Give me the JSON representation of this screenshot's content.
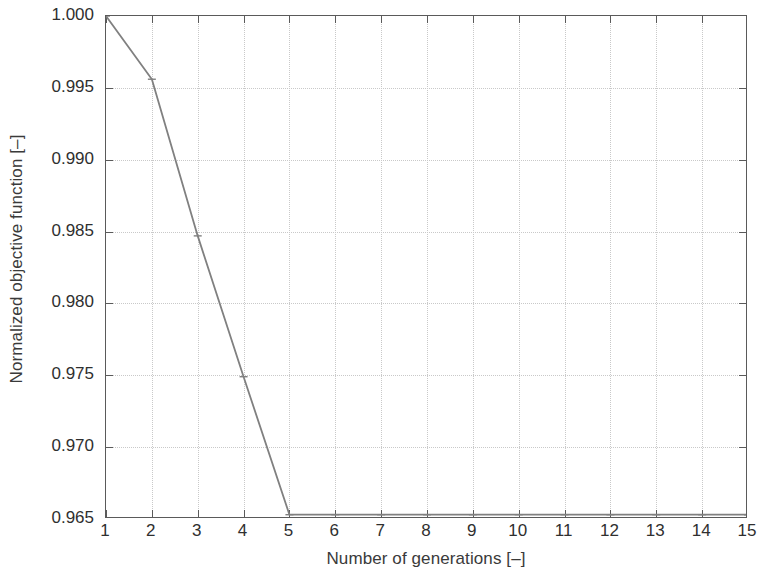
{
  "chart_data": {
    "type": "line",
    "title": "",
    "subtitle": "",
    "xlabel": "Number of generations [–]",
    "ylabel": "Normalized objective function [–]",
    "x": [
      1,
      2,
      3,
      4,
      5,
      6,
      7,
      8,
      9,
      10,
      11,
      12,
      13,
      14,
      15
    ],
    "values": [
      1.0,
      0.9956,
      0.9847,
      0.9749,
      0.9653,
      0.9653,
      0.9653,
      0.9653,
      0.9653,
      0.9653,
      0.9653,
      0.9653,
      0.9653,
      0.9653,
      0.9653
    ],
    "series": [
      {
        "name": "Normalized objective function",
        "values": [
          1.0,
          0.9956,
          0.9847,
          0.9749,
          0.9653,
          0.9653,
          0.9653,
          0.9653,
          0.9653,
          0.9653,
          0.9653,
          0.9653,
          0.9653,
          0.9653,
          0.9653
        ],
        "color": "#808080",
        "marker": "tick",
        "line_width": 1.8
      }
    ],
    "xlim": [
      1,
      15
    ],
    "ylim": [
      0.965,
      1.0
    ],
    "xticks": [
      1,
      2,
      3,
      4,
      5,
      6,
      7,
      8,
      9,
      10,
      11,
      12,
      13,
      14,
      15
    ],
    "yticks": [
      0.965,
      0.97,
      0.975,
      0.98,
      0.985,
      0.99,
      0.995,
      1.0
    ],
    "xticklabels": [
      "1",
      "2",
      "3",
      "4",
      "5",
      "6",
      "7",
      "8",
      "9",
      "10",
      "11",
      "12",
      "13",
      "14",
      "15"
    ],
    "yticklabels": [
      "0.965",
      "0.970",
      "0.975",
      "0.980",
      "0.985",
      "0.990",
      "0.995",
      "1.000"
    ],
    "grid": true,
    "grid_style": "dotted",
    "grid_color": "#c9c9c9",
    "legend": null,
    "legend_position": "none",
    "annotations": [],
    "background_color": "#ffffff",
    "axis_color": "#5a5a5a"
  }
}
